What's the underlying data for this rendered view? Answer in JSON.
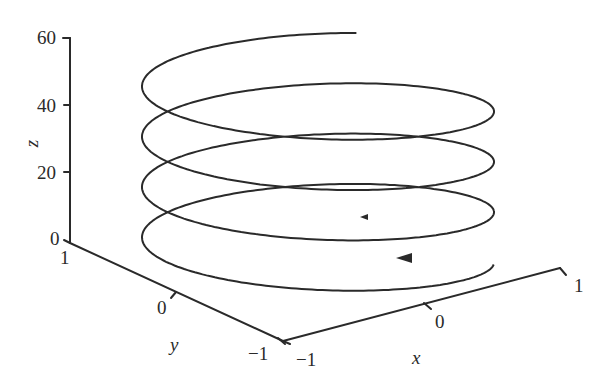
{
  "chart_data": {
    "type": "line",
    "subtype": "3d-parametric-helix",
    "title": "",
    "xlabel": "x",
    "ylabel": "y",
    "zlabel": "z",
    "x_ticks": [
      "-1",
      "0",
      "1"
    ],
    "y_ticks": [
      "1",
      "0",
      "-1"
    ],
    "z_ticks": [
      "0",
      "20",
      "40",
      "60"
    ],
    "xlim": [
      -1,
      1
    ],
    "ylim": [
      -1,
      1
    ],
    "zlim": [
      0,
      60
    ],
    "grid": false,
    "legend": null,
    "series": [
      {
        "name": "helix",
        "description": "x = cos t, y = sin t, z increasing linearly; about 4 turns from z≈0 to z≈60, direction arrows indicate travel",
        "turns": 4,
        "z_start": 0,
        "z_end": 60,
        "radius": 1,
        "color": "#2a2a2a"
      }
    ],
    "annotations": [
      "direction arrow on lower loop",
      "direction arrow on second loop"
    ]
  },
  "axes": {
    "z_label": "z",
    "x_label": "x",
    "y_label": "y",
    "z_tick_labels": [
      "60",
      "40",
      "20",
      "0"
    ],
    "y_tick_labels": [
      "1",
      "0",
      "−1"
    ],
    "x_tick_labels": [
      "−1",
      "0",
      "1"
    ]
  }
}
